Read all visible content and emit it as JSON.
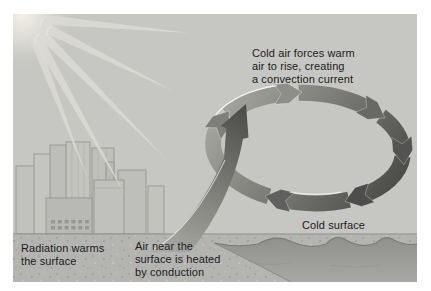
{
  "page": {
    "background": "#ffffff"
  },
  "diagram": {
    "background": "#c6c6c2",
    "labels": {
      "convection": {
        "lines": [
          "Cold air forces warm",
          "air to rise, creating",
          "a convection current"
        ]
      },
      "radiation": {
        "lines": [
          "Radiation warms",
          "the surface"
        ]
      },
      "conduction": {
        "lines": [
          "Air near the",
          "surface is heated",
          "by conduction"
        ]
      },
      "cold_surface": {
        "lines": [
          "Cold surface"
        ]
      }
    },
    "colors": {
      "sky": "#c6c6c2",
      "text": "#1c1c1c",
      "ring_arrow_dark": "#474745",
      "ring_arrow_light": "#a6a6a0",
      "warm_arrow_dark": "#4e4e4c",
      "warm_arrow_light": "#a8a8a2",
      "water": "#9c9c98",
      "ground": "#b2b2ae",
      "sun_glow": "#f0eee6"
    }
  }
}
